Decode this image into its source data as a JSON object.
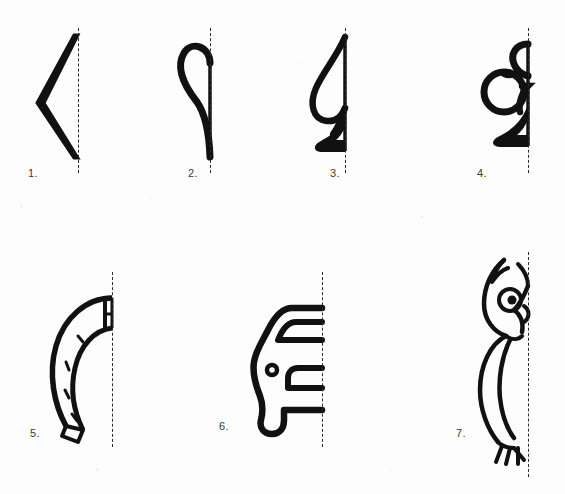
{
  "sheet": {
    "width": 565,
    "height": 494,
    "background_color": "#fdfdfd",
    "ink_color": "#111111",
    "mirror_line_color": "#2b2b2b",
    "label_color": "#3a3a3a",
    "mirror_line_style": "dashed"
  },
  "figures": [
    {
      "number": "1.",
      "name": "chevron-half",
      "description": "half of an arrow / rhombus shape, a thick V opening toward the mirror line",
      "label_x": 28,
      "label_y": 167,
      "mirror_x": 78,
      "mirror_y": 28,
      "mirror_height": 145
    },
    {
      "number": "2.",
      "name": "heart-half",
      "description": "left half of a heart outline",
      "label_x": 188,
      "label_y": 167,
      "mirror_x": 210,
      "mirror_y": 28,
      "mirror_height": 145
    },
    {
      "number": "3.",
      "name": "spade-half",
      "description": "left half of a playing-card spade with stem",
      "label_x": 330,
      "label_y": 167,
      "mirror_x": 345,
      "mirror_y": 28,
      "mirror_height": 145
    },
    {
      "number": "4.",
      "name": "club-half",
      "description": "left half of a playing-card club with stem",
      "label_x": 477,
      "label_y": 167,
      "mirror_x": 528,
      "mirror_y": 28,
      "mirror_height": 145
    },
    {
      "number": "5.",
      "name": "horseshoe-half",
      "description": "left half of a horseshoe with nail-hole marks",
      "label_x": 30,
      "label_y": 427,
      "mirror_x": 112,
      "mirror_y": 272,
      "mirror_height": 175
    },
    {
      "number": "6.",
      "name": "car-half",
      "description": "left half of a car silhouette seen from the front",
      "label_x": 219,
      "label_y": 420,
      "mirror_x": 322,
      "mirror_y": 272,
      "mirror_height": 175
    },
    {
      "number": "7.",
      "name": "owl-half",
      "description": "left half of a perched owl with ear tuft, eye, beak, wing and talons",
      "label_x": 456,
      "label_y": 427,
      "mirror_x": 528,
      "mirror_y": 252,
      "mirror_height": 225
    }
  ]
}
